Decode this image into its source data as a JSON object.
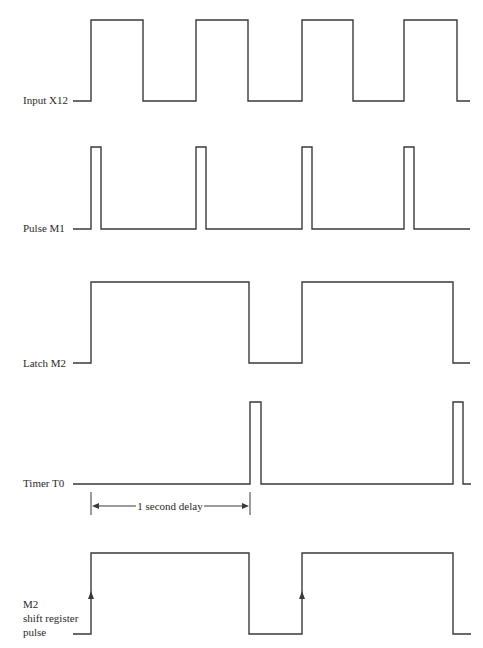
{
  "diagram": {
    "type": "timing-diagram",
    "line_color": "#3a3a3a",
    "text_color": "#2a2a2a",
    "signals": [
      {
        "id": "input-x12",
        "label_lines": [
          "Input X12"
        ],
        "label_x": 23,
        "label_y": [
          104
        ],
        "low_y": 101,
        "high_y": 20,
        "start_x": 73,
        "end_x": 470,
        "initial": 0,
        "transitions": [
          91,
          143,
          196,
          248,
          302,
          353,
          404,
          457
        ]
      },
      {
        "id": "pulse-m1",
        "label_lines": [
          "Pulse M1"
        ],
        "label_x": 23,
        "label_y": [
          232
        ],
        "low_y": 229,
        "high_y": 147,
        "start_x": 73,
        "end_x": 470,
        "initial": 0,
        "transitions": [
          91,
          101,
          196,
          206,
          302,
          312,
          404,
          414
        ]
      },
      {
        "id": "latch-m2",
        "label_lines": [
          "Latch M2"
        ],
        "label_x": 23,
        "label_y": [
          367
        ],
        "low_y": 363,
        "high_y": 282,
        "start_x": 73,
        "end_x": 470,
        "initial": 0,
        "transitions": [
          91,
          249,
          302,
          453
        ]
      },
      {
        "id": "timer-t0",
        "label_lines": [
          "Timer T0"
        ],
        "label_x": 23,
        "label_y": [
          487
        ],
        "low_y": 484,
        "high_y": 402,
        "start_x": 73,
        "end_x": 471,
        "initial": 0,
        "transitions": [
          250,
          261,
          453,
          463
        ]
      },
      {
        "id": "m2-shift-register-pulse",
        "label_lines": [
          "M2",
          "shift register",
          "pulse"
        ],
        "label_x": 23,
        "label_y": [
          608,
          622,
          636
        ],
        "low_y": 634,
        "high_y": 553,
        "start_x": 73,
        "end_x": 471,
        "initial": 0,
        "transitions": [
          91,
          249,
          302,
          453
        ],
        "edge_arrows": [
          {
            "x": 91,
            "y": 596
          },
          {
            "x": 302,
            "y": 596
          }
        ]
      }
    ],
    "annotation": {
      "text": "1 second delay",
      "left_x": 91,
      "right_x": 250,
      "tick_top": 492,
      "tick_bottom": 515,
      "arrow_y": 506,
      "text_x": 170,
      "text_y": 510,
      "gap_left": 136,
      "gap_right": 204
    }
  }
}
